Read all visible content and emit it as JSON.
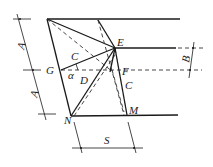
{
  "diagram": {
    "points": {
      "top_left": {
        "x": 47,
        "y": 19
      },
      "top_second": {
        "x": 98,
        "y": 20
      },
      "E": {
        "x": 115,
        "y": 48,
        "label": "E"
      },
      "G": {
        "x": 61,
        "y": 70,
        "label": "G"
      },
      "F": {
        "x": 113,
        "y": 70,
        "label": "F"
      },
      "N": {
        "x": 71,
        "y": 116,
        "label": "N"
      },
      "M": {
        "x": 127,
        "y": 115,
        "label": "M"
      }
    },
    "labels": {
      "E": "E",
      "G": "G",
      "F": "F",
      "N": "N",
      "M": "M",
      "C_upper": "C",
      "C_right": "C",
      "D": "D",
      "alpha": "α",
      "A_upper": "A",
      "A_lower": "A",
      "B": "B",
      "S": "S"
    },
    "dimensions": {
      "A": {
        "description": "vertical spacing between top line and dashed line, and between dashed line and bottom line"
      },
      "B": {
        "description": "spacing between E-level line and dashed F-level line"
      },
      "S": {
        "description": "horizontal offset between N and M"
      }
    }
  }
}
